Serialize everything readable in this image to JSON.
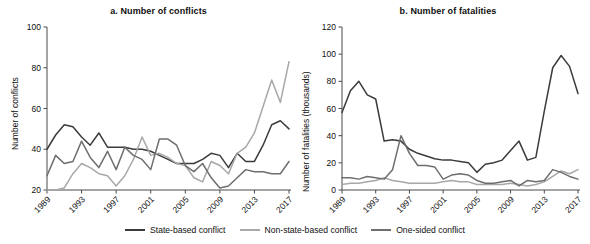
{
  "figure": {
    "width": 590,
    "height": 244
  },
  "legend": {
    "items": [
      {
        "label": "State-based conflict",
        "color": "#3b3b3b",
        "key": "state_based"
      },
      {
        "label": "Non-state-based conflict",
        "color": "#a8a8a8",
        "key": "non_state_based"
      },
      {
        "label": "One-sided conflict",
        "color": "#6e6e6e",
        "key": "one_sided"
      }
    ]
  },
  "chart_data": [
    {
      "type": "line",
      "id": "panel-a",
      "title": "a. Number of conflicts",
      "xlabel": "",
      "ylabel": "Number of conflicts",
      "ylim": [
        20,
        100
      ],
      "yticks": [
        20,
        40,
        60,
        80,
        100
      ],
      "ytick_labels": [
        "20",
        "40",
        "60",
        "80",
        "100"
      ],
      "xlim": [
        1989,
        2017
      ],
      "xticks": [
        1989,
        1993,
        1997,
        2001,
        2005,
        2009,
        2013,
        2017
      ],
      "xtick_labels": [
        "1989",
        "1993",
        "1997",
        "2001",
        "2005",
        "2009",
        "2013",
        "2017"
      ],
      "grid": false,
      "legend_position": "below-figure",
      "x": [
        1989,
        1990,
        1991,
        1992,
        1993,
        1994,
        1995,
        1996,
        1997,
        1998,
        1999,
        2000,
        2001,
        2002,
        2003,
        2004,
        2005,
        2006,
        2007,
        2008,
        2009,
        2010,
        2011,
        2012,
        2013,
        2014,
        2015,
        2016,
        2017
      ],
      "series": [
        {
          "name": "State-based conflict",
          "color": "#3b3b3b",
          "values": [
            40,
            47,
            52,
            51,
            46,
            42,
            48,
            41,
            41,
            41,
            40,
            40,
            39,
            37,
            35,
            33,
            33,
            33,
            35,
            38,
            37,
            31,
            38,
            34,
            34,
            42,
            52,
            54,
            50
          ]
        },
        {
          "name": "Non-state-based conflict",
          "color": "#a8a8a8",
          "values": [
            20,
            20,
            21,
            28,
            33,
            31,
            28,
            27,
            22,
            27,
            35,
            46,
            37,
            38,
            36,
            33,
            32,
            26,
            24,
            34,
            32,
            28,
            38,
            41,
            48,
            61,
            74,
            63,
            83
          ]
        },
        {
          "name": "One-sided conflict",
          "color": "#6e6e6e",
          "values": [
            27,
            37,
            33,
            34,
            44,
            36,
            31,
            39,
            30,
            41,
            37,
            35,
            30,
            45,
            45,
            42,
            32,
            29,
            33,
            26,
            21,
            22,
            26,
            30,
            29,
            29,
            28,
            28,
            34
          ]
        }
      ]
    },
    {
      "type": "line",
      "id": "panel-b",
      "title": "b. Number of fatalities",
      "xlabel": "",
      "ylabel": "Number of fatalities (thousands)",
      "ylim": [
        0,
        120
      ],
      "yticks": [
        0,
        20,
        40,
        60,
        80,
        100,
        120
      ],
      "ytick_labels": [
        "0",
        "20",
        "40",
        "60",
        "80",
        "100",
        "120"
      ],
      "xlim": [
        1989,
        2017
      ],
      "xticks": [
        1989,
        1993,
        1997,
        2001,
        2005,
        2009,
        2013,
        2017
      ],
      "xtick_labels": [
        "1989",
        "1993",
        "1997",
        "2001",
        "2005",
        "2009",
        "2013",
        "2017"
      ],
      "grid": false,
      "legend_position": "below-figure",
      "units": "thousands",
      "x": [
        1989,
        1990,
        1991,
        1992,
        1993,
        1994,
        1995,
        1996,
        1997,
        1998,
        1999,
        2000,
        2001,
        2002,
        2003,
        2004,
        2005,
        2006,
        2007,
        2008,
        2009,
        2010,
        2011,
        2012,
        2013,
        2014,
        2015,
        2016,
        2017
      ],
      "series": [
        {
          "name": "State-based conflict",
          "color": "#3b3b3b",
          "values": [
            57,
            73,
            80,
            70,
            67,
            36,
            37,
            36,
            30,
            27,
            25,
            23,
            22,
            22,
            21,
            20,
            13,
            19,
            20,
            22,
            29,
            36,
            22,
            24,
            58,
            90,
            99,
            91,
            71
          ]
        },
        {
          "name": "Non-state-based conflict",
          "color": "#a8a8a8",
          "values": [
            4,
            5,
            5,
            6,
            7,
            9,
            7,
            6,
            5,
            5,
            5,
            5,
            6,
            7,
            6,
            6,
            4,
            4,
            4,
            4,
            5,
            4,
            3,
            4,
            6,
            10,
            14,
            12,
            15
          ]
        },
        {
          "name": "One-sided conflict",
          "color": "#6e6e6e",
          "values": [
            9,
            9,
            8,
            10,
            9,
            8,
            15,
            40,
            27,
            18,
            18,
            17,
            8,
            11,
            12,
            11,
            7,
            5,
            5,
            6,
            7,
            3,
            7,
            6,
            7,
            15,
            13,
            10,
            8
          ]
        }
      ]
    }
  ]
}
